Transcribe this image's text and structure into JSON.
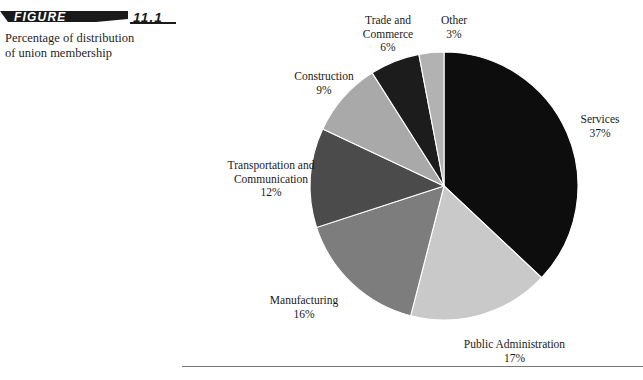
{
  "figure": {
    "banner_label": "FIGURE",
    "banner_number": "11.1",
    "caption_line_1": "Percentage of distribution",
    "caption_line_2": "of union membership"
  },
  "chart_data": {
    "type": "pie",
    "title": "Percentage of distribution of union membership",
    "xlabel": "",
    "ylabel": "",
    "legend_position": "none",
    "grid": false,
    "units": "percent",
    "start_angle_deg": 0,
    "direction": "clockwise",
    "categories": [
      "Services",
      "Public Administration",
      "Manufacturing",
      "Transportation and Communication",
      "Construction",
      "Trade and Commerce",
      "Other"
    ],
    "values": [
      37,
      17,
      16,
      12,
      9,
      6,
      3
    ],
    "colors": [
      "#0d0d0d",
      "#c9c9c9",
      "#7d7d7d",
      "#4b4b4b",
      "#a9a9a9",
      "#1c1c1c",
      "#b2b2b2"
    ],
    "slices": [
      {
        "name": "Services",
        "value": 37,
        "label_name": "Services",
        "label_value": "37%",
        "color": "#0d0d0d"
      },
      {
        "name": "Public Administration",
        "value": 17,
        "label_name": "Public Administration",
        "label_value": "17%",
        "color": "#c9c9c9"
      },
      {
        "name": "Manufacturing",
        "value": 16,
        "label_name": "Manufacturing",
        "label_value": "16%",
        "color": "#7d7d7d"
      },
      {
        "name": "Transportation and Communication",
        "value": 12,
        "label_name_line_1": "Transportation and",
        "label_name_line_2": "Communication",
        "label_value": "12%",
        "color": "#4b4b4b"
      },
      {
        "name": "Construction",
        "value": 9,
        "label_name": "Construction",
        "label_value": "9%",
        "color": "#a9a9a9"
      },
      {
        "name": "Trade and Commerce",
        "value": 6,
        "label_name_line_1": "Trade and",
        "label_name_line_2": "Commerce",
        "label_value": "6%",
        "color": "#1c1c1c"
      },
      {
        "name": "Other",
        "value": 3,
        "label_name": "Other",
        "label_value": "3%",
        "color": "#b2b2b2"
      }
    ]
  },
  "geometry": {
    "center_x": 444,
    "center_y": 186,
    "radius": 134
  }
}
